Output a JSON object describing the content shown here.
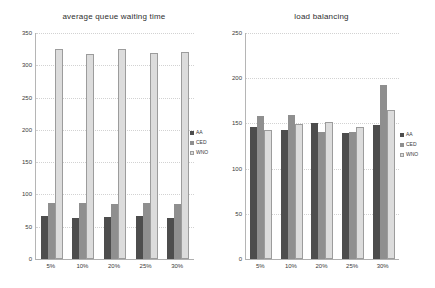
{
  "palette": {
    "aa": "#4d4d4d",
    "ced": "#8f8f8f",
    "wno_fill": "#dcdcdc",
    "wno_border": "#9c9c9c",
    "grid": "#d2d2d2",
    "axis": "#b0b0b0",
    "text": "#3a3a3a"
  },
  "chart_data": [
    {
      "type": "bar",
      "title": "average queue waiting time",
      "categories": [
        "5%",
        "10%",
        "20%",
        "25%",
        "30%"
      ],
      "series": [
        {
          "name": "AA",
          "color": "#4d4d4d",
          "values": [
            66,
            64,
            65,
            67,
            64
          ]
        },
        {
          "name": "CED",
          "color": "#8f8f8f",
          "values": [
            86,
            86,
            85,
            86,
            85
          ]
        },
        {
          "name": "WNO",
          "color": "#dcdcdc",
          "border": "#9c9c9c",
          "values": [
            325,
            317,
            325,
            319,
            320
          ]
        }
      ],
      "xlabel": "",
      "ylabel": "",
      "ylim": [
        0,
        350
      ],
      "yticks": [
        0,
        50,
        100,
        150,
        200,
        250,
        300,
        350
      ],
      "grid": true,
      "legend_position": "right-middle",
      "legend": [
        "AA",
        "CED",
        "WNO"
      ]
    },
    {
      "type": "bar",
      "title": "load balancing",
      "categories": [
        "5%",
        "10%",
        "20%",
        "25%",
        "30%"
      ],
      "series": [
        {
          "name": "AA",
          "color": "#4d4d4d",
          "values": [
            146,
            143,
            151,
            139,
            148
          ]
        },
        {
          "name": "CED",
          "color": "#8f8f8f",
          "values": [
            158,
            159,
            141,
            140,
            192
          ]
        },
        {
          "name": "WNO",
          "color": "#dcdcdc",
          "border": "#9c9c9c",
          "values": [
            143,
            149,
            152,
            146,
            165
          ]
        }
      ],
      "xlabel": "",
      "ylabel": "",
      "ylim": [
        0,
        250
      ],
      "yticks": [
        0,
        50,
        100,
        150,
        200,
        250
      ],
      "grid": true,
      "legend_position": "right-middle",
      "legend": [
        "AA",
        "CED",
        "WNO"
      ]
    }
  ]
}
